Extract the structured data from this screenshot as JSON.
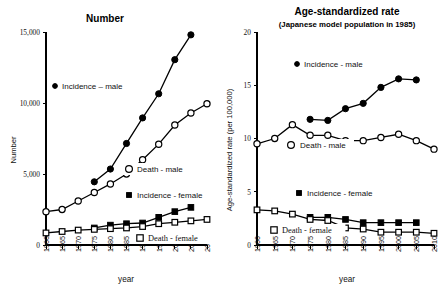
{
  "figure": {
    "width": 445,
    "height": 286,
    "background": "#ffffff",
    "ink_color": "#000000"
  },
  "chart_data": [
    {
      "id": "left",
      "type": "line",
      "title": "Number",
      "subtitle": "",
      "xlabel": "year",
      "ylabel": "Number",
      "xlim": [
        1960,
        2010
      ],
      "ylim": [
        0,
        15000
      ],
      "xticks": [
        1960,
        1965,
        1970,
        1975,
        1980,
        1985,
        1990,
        1995,
        2000,
        2005,
        2010
      ],
      "xticklabels": [
        "1960",
        "1965",
        "1970",
        "1975",
        "1980",
        "1985",
        "1990",
        "1995",
        "2000",
        "2005",
        "2010"
      ],
      "yticks": [
        0,
        5000,
        10000,
        15000
      ],
      "yticklabels": [
        "0",
        "5,000",
        "10,000",
        "15,000"
      ],
      "grid": false,
      "legend_position": "inside",
      "series": [
        {
          "name": "Incidence – male",
          "marker": "filled-circle",
          "x": [
            1975,
            1980,
            1985,
            1990,
            1995,
            2000,
            2005
          ],
          "values": [
            4450,
            5350,
            7150,
            8950,
            10650,
            13050,
            14800
          ]
        },
        {
          "name": "Death - male",
          "marker": "open-circle",
          "x": [
            1960,
            1965,
            1970,
            1975,
            1980,
            1985,
            1990,
            1995,
            2000,
            2005,
            2010
          ],
          "values": [
            2350,
            2500,
            3100,
            3700,
            4300,
            5000,
            6000,
            7100,
            8450,
            9300,
            9950
          ]
        },
        {
          "name": "Incidence - female",
          "marker": "filled-square",
          "x": [
            1975,
            1980,
            1985,
            1990,
            1995,
            2000,
            2005
          ],
          "values": [
            1200,
            1400,
            1500,
            1550,
            1950,
            2350,
            2650
          ]
        },
        {
          "name": "Death - female",
          "marker": "open-square",
          "x": [
            1960,
            1965,
            1970,
            1975,
            1980,
            1985,
            1990,
            1995,
            2000,
            2005,
            2010
          ],
          "values": [
            850,
            950,
            1050,
            1100,
            1150,
            1200,
            1300,
            1500,
            1600,
            1700,
            1800
          ]
        }
      ]
    },
    {
      "id": "right",
      "type": "line",
      "title": "Age-standardized rate",
      "subtitle": "(Japanese model population in 1985)",
      "xlabel": "year",
      "ylabel": "Age-standardized rate (per 100,000)",
      "xlim": [
        1960,
        2010
      ],
      "ylim": [
        0,
        20
      ],
      "xticks": [
        1960,
        1965,
        1970,
        1975,
        1980,
        1985,
        1990,
        1995,
        2000,
        2005,
        2010
      ],
      "xticklabels": [
        "1960",
        "1965",
        "1970",
        "1975",
        "1980",
        "1985",
        "1990",
        "1995",
        "2000",
        "2005",
        "2010"
      ],
      "yticks": [
        0,
        5,
        10,
        15,
        20
      ],
      "yticklabels": [
        "0",
        "5",
        "10",
        "15",
        "20"
      ],
      "grid": false,
      "legend_position": "inside",
      "series": [
        {
          "name": "Incidence - male",
          "marker": "filled-circle",
          "x": [
            1975,
            1980,
            1985,
            1990,
            1995,
            2000,
            2005
          ],
          "values": [
            11.8,
            11.7,
            12.8,
            13.3,
            14.8,
            15.6,
            15.5
          ]
        },
        {
          "name": "Death - male",
          "marker": "open-circle",
          "x": [
            1960,
            1965,
            1970,
            1975,
            1980,
            1985,
            1990,
            1995,
            2000,
            2005,
            2010
          ],
          "values": [
            9.5,
            10.0,
            11.3,
            10.3,
            10.3,
            9.8,
            9.8,
            10.1,
            10.4,
            9.8,
            9.0
          ]
        },
        {
          "name": "Incidence - female",
          "marker": "filled-square",
          "x": [
            1975,
            1980,
            1985,
            1990,
            1995,
            2000,
            2005
          ],
          "values": [
            2.6,
            2.6,
            2.4,
            2.1,
            2.1,
            2.1,
            2.1
          ]
        },
        {
          "name": "Death - female",
          "marker": "open-square",
          "x": [
            1960,
            1965,
            1970,
            1975,
            1980,
            1985,
            1990,
            1995,
            2000,
            2005,
            2010
          ],
          "values": [
            3.3,
            3.2,
            2.9,
            2.4,
            2.3,
            1.6,
            1.5,
            1.2,
            1.2,
            1.2,
            1.1
          ]
        }
      ]
    }
  ]
}
